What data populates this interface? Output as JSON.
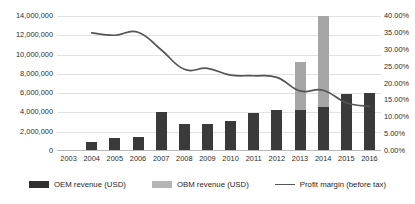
{
  "chart_data": {
    "type": "bar",
    "title": "",
    "subtitle": "",
    "xlabel": "",
    "ylabel": "",
    "y2label": "",
    "grid": true,
    "legend_position": "bottom",
    "categories": [
      "2003",
      "2004",
      "2005",
      "2006",
      "2007",
      "2008",
      "2009",
      "2010",
      "2011",
      "2012",
      "2013",
      "2014",
      "2015",
      "2016"
    ],
    "ylim": [
      0,
      14000000
    ],
    "ytick_labels": [
      "0",
      "2,000,000",
      "4,000,000",
      "6,000,000",
      "8,000,000",
      "10,000,000",
      "12,000,000",
      "14,000,000"
    ],
    "ytick_values": [
      0,
      2000000,
      4000000,
      6000000,
      8000000,
      10000000,
      12000000,
      14000000
    ],
    "y2lim": [
      0,
      0.4
    ],
    "y2tick_labels": [
      "0.00%",
      "5.00%",
      "10.00%",
      "15.00%",
      "20.00%",
      "25.00%",
      "30.00%",
      "35.00%",
      "40.00%"
    ],
    "y2tick_values": [
      0,
      0.05,
      0.1,
      0.15,
      0.2,
      0.25,
      0.3,
      0.35,
      0.4
    ],
    "stacked": true,
    "series": [
      {
        "name": "OEM revenue (USD)",
        "key": "oem",
        "type": "bar",
        "color": "#3a3a3a",
        "axis": "left",
        "values": [
          null,
          900000,
          1400000,
          1450000,
          4000000,
          2850000,
          2850000,
          3100000,
          3950000,
          4300000,
          4300000,
          4600000,
          5950000,
          6000000
        ]
      },
      {
        "name": "OBM revenue (USD)",
        "key": "obm",
        "type": "bar",
        "color": "#a6a6a6",
        "axis": "left",
        "values": [
          null,
          0,
          0,
          0,
          0,
          0,
          0,
          0,
          0,
          0,
          4900000,
          9400000,
          0,
          0
        ]
      },
      {
        "name": "Profit margin (before tax)",
        "key": "margin",
        "type": "line",
        "color": "#555555",
        "axis": "right",
        "values": [
          null,
          0.35,
          0.343,
          0.352,
          0.3,
          0.242,
          0.245,
          0.225,
          0.223,
          0.218,
          0.178,
          0.18,
          0.143,
          0.132
        ]
      }
    ]
  },
  "legend": {
    "items": [
      {
        "label": "OEM revenue (USD)",
        "marker": "bar-dark-swatch",
        "color": "#2f2f2f"
      },
      {
        "label": "OBM revenue (USD)",
        "marker": "bar-light-swatch",
        "color": "#b5b5b5"
      },
      {
        "label": "Profit margin (before tax)",
        "marker": "line-swatch",
        "color": "#555555"
      }
    ]
  }
}
